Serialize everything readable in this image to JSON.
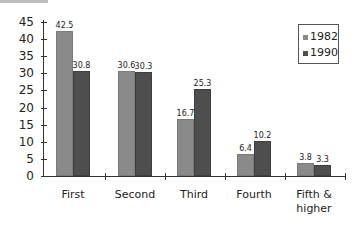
{
  "chart_data": {
    "type": "bar",
    "title": "",
    "xlabel": "",
    "ylabel": "",
    "categories": [
      "First",
      "Second",
      "Third",
      "Fourth",
      "Fifth & higher"
    ],
    "series": [
      {
        "name": "1982",
        "color": "#8a8a8a",
        "values": [
          42.5,
          30.6,
          16.7,
          6.4,
          3.8
        ]
      },
      {
        "name": "1990",
        "color": "#4e4e4e",
        "values": [
          30.8,
          30.3,
          25.3,
          10.2,
          3.3
        ]
      }
    ],
    "ylim": [
      0,
      45
    ],
    "yticks": [
      0,
      5,
      10,
      15,
      20,
      25,
      30,
      35,
      40,
      45
    ],
    "grid": false,
    "legend_position": "upper right",
    "data_labels": true
  },
  "labels": {
    "yticks": [
      "0",
      "5",
      "10",
      "15",
      "20",
      "25",
      "30",
      "35",
      "40",
      "45"
    ],
    "categories": [
      "First",
      "Second",
      "Third",
      "Fourth",
      "Fifth &",
      "higher"
    ],
    "values_1982": [
      "42.5",
      "30.6",
      "16.7",
      "6.4",
      "3.8"
    ],
    "values_1990": [
      "30.8",
      "30.3",
      "25.3",
      "10.2",
      "3.3"
    ],
    "legend": [
      "1982",
      "1990"
    ]
  }
}
